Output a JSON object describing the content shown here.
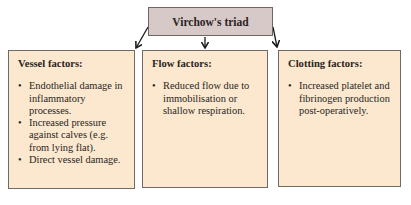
{
  "diagram": {
    "title": "Virchow's triad",
    "colors": {
      "title_fill": "#d7c9c8",
      "box_fill": "#fbe8cf",
      "border": "#6f6a66",
      "arrow": "#1a1a1a"
    },
    "boxes": [
      {
        "heading": "Vessel factors:",
        "items": [
          "Endothelial damage in inflammatory processes.",
          "Increased pressure against calves (e.g. from lying flat).",
          "Direct vessel damage."
        ]
      },
      {
        "heading": "Flow factors:",
        "items": [
          "Reduced flow due to immobilisation or shallow respiration."
        ]
      },
      {
        "heading": "Clotting factors:",
        "items": [
          "Increased platelet and fibrinogen production post-operatively."
        ]
      }
    ],
    "connections": [
      {
        "from": "Virchow's triad",
        "to": "Vessel factors:"
      },
      {
        "from": "Virchow's triad",
        "to": "Flow factors:"
      },
      {
        "from": "Virchow's triad",
        "to": "Clotting factors:"
      }
    ]
  }
}
